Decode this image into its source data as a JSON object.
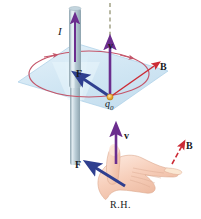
{
  "figure": {
    "panels": [
      {
        "name": "field-diagram",
        "description": "Vertical current-carrying wire with circular magnetic field line in a horizontal plane, and a positive charge q0 moving with velocity v experiencing force F"
      },
      {
        "name": "right-hand-diagram",
        "description": "Open right hand showing thumb along v, fingers along B, palm pushing along F"
      }
    ]
  },
  "labels": {
    "current": "I",
    "velocity_top": "v",
    "field_top": "B",
    "force_top": "F",
    "charge": "q",
    "charge_sub": "0",
    "velocity_hand": "v",
    "field_hand": "B",
    "force_hand": "F",
    "right_hand": "R.H."
  },
  "colors": {
    "velocity_arrow": "#6b2d8e",
    "field_arrow": "#cc2b35",
    "force_arrow": "#2f3f8f",
    "field_circle": "#c4566a",
    "plane_fill": "#cfe4f2",
    "plane_stroke": "#a9cfe6",
    "wire_body": "#9fb3bd",
    "wire_highlight": "#d6e3ea",
    "charge_dot": "#e8a22a",
    "dashed_axis": "#6a6a3c",
    "skin_light": "#fbe0d2",
    "skin_mid": "#f3c7b2",
    "skin_shadow": "#e3a98f",
    "text": "#1a1a22"
  },
  "icons": {
    "velocity_arrow": "up-arrow-icon",
    "field_arrow": "diagonal-arrow-icon",
    "force_arrow": "diagonal-arrow-icon",
    "charge": "point-charge-dot-icon",
    "hand": "right-hand-icon",
    "wire": "current-wire-icon",
    "field_loop": "magnetic-field-circle-icon",
    "plane": "reference-plane-icon",
    "axis": "dashed-axis-icon"
  }
}
